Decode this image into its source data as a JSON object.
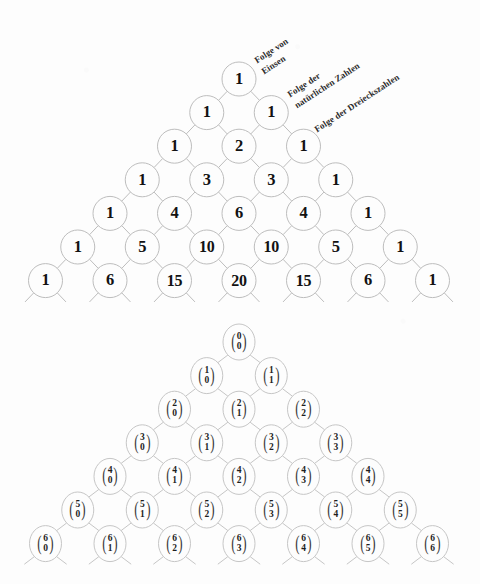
{
  "figure": {
    "background_color": "#fdfdfd",
    "ink_color": "#1a1a1a",
    "circle_stroke_color": "#bdbdbd"
  },
  "annotations": [
    {
      "id": "folge-von-einsen",
      "line1": "Folge von",
      "line2": "Einsen",
      "angle_deg": -33,
      "x": 252,
      "y": 56
    },
    {
      "id": "folge-natuerliche-zahlen",
      "line1": "Folge der",
      "line2": "natürlichen Zahlen",
      "angle_deg": -33,
      "x": 285,
      "y": 90
    },
    {
      "id": "folge-dreieckszahlen",
      "line1": "Folge der Dreieckszahlen",
      "line2": "",
      "angle_deg": -33,
      "x": 312,
      "y": 125
    }
  ],
  "chart_data": {
    "type": "diagram",
    "upper_triangle": {
      "caption": "Pascal triangle with binomial coefficient values",
      "rows": [
        {
          "n": 0,
          "values": [
            "1"
          ]
        },
        {
          "n": 1,
          "values": [
            "1",
            "1"
          ]
        },
        {
          "n": 2,
          "values": [
            "1",
            "2",
            "1"
          ]
        },
        {
          "n": 3,
          "values": [
            "1",
            "3",
            "3",
            "1"
          ]
        },
        {
          "n": 4,
          "values": [
            "1",
            "4",
            "6",
            "4",
            "1"
          ]
        },
        {
          "n": 5,
          "values": [
            "1",
            "5",
            "10",
            "10",
            "5",
            "1"
          ]
        },
        {
          "n": 6,
          "values": [
            "1",
            "6",
            "15",
            "20",
            "15",
            "6",
            "1"
          ]
        }
      ]
    },
    "lower_triangle": {
      "caption": "Pascal triangle in binomial coefficient notation (n choose k)",
      "rows": [
        {
          "n": 0,
          "cells": [
            {
              "top": "0",
              "bottom": "0"
            }
          ]
        },
        {
          "n": 1,
          "cells": [
            {
              "top": "1",
              "bottom": "0"
            },
            {
              "top": "1",
              "bottom": "1"
            }
          ]
        },
        {
          "n": 2,
          "cells": [
            {
              "top": "2",
              "bottom": "0"
            },
            {
              "top": "2",
              "bottom": "1"
            },
            {
              "top": "2",
              "bottom": "2"
            }
          ]
        },
        {
          "n": 3,
          "cells": [
            {
              "top": "3",
              "bottom": "0"
            },
            {
              "top": "3",
              "bottom": "1"
            },
            {
              "top": "3",
              "bottom": "2"
            },
            {
              "top": "3",
              "bottom": "3"
            }
          ]
        },
        {
          "n": 4,
          "cells": [
            {
              "top": "4",
              "bottom": "0"
            },
            {
              "top": "4",
              "bottom": "1"
            },
            {
              "top": "4",
              "bottom": "2"
            },
            {
              "top": "4",
              "bottom": "3"
            },
            {
              "top": "4",
              "bottom": "4"
            }
          ]
        },
        {
          "n": 5,
          "cells": [
            {
              "top": "5",
              "bottom": "0"
            },
            {
              "top": "5",
              "bottom": "1"
            },
            {
              "top": "5",
              "bottom": "2"
            },
            {
              "top": "5",
              "bottom": "3"
            },
            {
              "top": "5",
              "bottom": "4"
            },
            {
              "top": "5",
              "bottom": "5"
            }
          ]
        },
        {
          "n": 6,
          "cells": [
            {
              "top": "6",
              "bottom": "0"
            },
            {
              "top": "6",
              "bottom": "1"
            },
            {
              "top": "6",
              "bottom": "2"
            },
            {
              "top": "6",
              "bottom": "3"
            },
            {
              "top": "6",
              "bottom": "4"
            },
            {
              "top": "6",
              "bottom": "5"
            },
            {
              "top": "6",
              "bottom": "6"
            }
          ]
        }
      ]
    },
    "layout": {
      "upper_apex_x": 239,
      "upper_apex_y": 79,
      "lower_apex_x": 239,
      "lower_apex_y": 342,
      "row_spacing": 33.6,
      "col_spacing": 64.5,
      "circle_radius": 17
    }
  }
}
